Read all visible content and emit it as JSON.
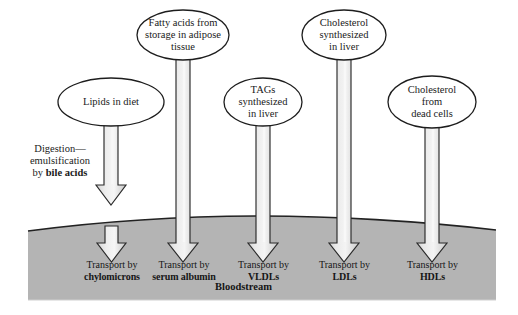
{
  "figure": {
    "colors": {
      "background": "#ffffff",
      "bloodstream_fill": "#b4b4b4",
      "arrow_fill_light": "#efefef",
      "arrow_fill_mid": "#d9d9d9",
      "outline": "#1a1a1a",
      "text": "#1a1a1a"
    }
  },
  "sources": [
    {
      "id": "lipids-in-diet",
      "label": "Lipids in diet",
      "lines": [
        "Lipids in diet"
      ]
    },
    {
      "id": "fatty-acids-adipose",
      "label": "Fatty acids from storage in adipose tissue",
      "lines": [
        "Fatty acids from",
        "storage in adipose",
        "tissue"
      ]
    },
    {
      "id": "tags-synthesized-liver",
      "label": "TAGs synthesized in liver",
      "lines": [
        "TAGs",
        "synthesized",
        "in liver"
      ]
    },
    {
      "id": "cholesterol-synthesized-liver",
      "label": "Cholesterol synthesized in liver",
      "lines": [
        "Cholesterol",
        "synthesized",
        "in liver"
      ]
    },
    {
      "id": "cholesterol-dead-cells",
      "label": "Cholesterol from dead cells",
      "lines": [
        "Cholesterol",
        "from",
        "dead cells"
      ]
    }
  ],
  "annotation": {
    "id": "digestion-emulsification",
    "line1": "Digestion—",
    "line2": "emulsification",
    "line3_prefix": "by ",
    "line3_bold": "bile acids"
  },
  "destinations": [
    {
      "id": "transport-chylomicrons",
      "prefix": "Transport by",
      "carrier": "chylomicrons"
    },
    {
      "id": "transport-serum-albumin",
      "prefix": "Transport by",
      "carrier": "serum albumin"
    },
    {
      "id": "transport-vldls",
      "prefix": "Transport by",
      "carrier": "VLDLs"
    },
    {
      "id": "transport-ldls",
      "prefix": "Transport by",
      "carrier": "LDLs"
    },
    {
      "id": "transport-hdls",
      "prefix": "Transport by",
      "carrier": "HDLs"
    }
  ],
  "bloodstream": {
    "id": "bloodstream",
    "label": "Bloodstream"
  }
}
